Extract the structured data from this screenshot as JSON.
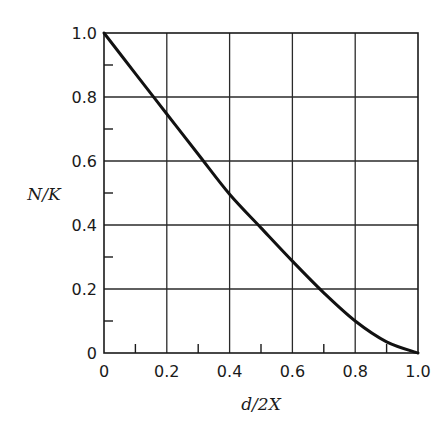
{
  "chart_data": {
    "type": "line",
    "title": "",
    "xlabel": "d/2X",
    "ylabel": "N/K",
    "xlim": [
      0,
      1.0
    ],
    "ylim": [
      0,
      1.0
    ],
    "grid": true,
    "legend": null,
    "x_ticks_major": [
      "0",
      "0.2",
      "0.4",
      "0.6",
      "0.8",
      "1.0"
    ],
    "y_ticks_major": [
      "0",
      "0.2",
      "0.4",
      "0.6",
      "0.8",
      "1.0"
    ],
    "minor_ticks": [
      0.1,
      0.3,
      0.5,
      0.7,
      0.9
    ],
    "series": [
      {
        "name": "N/K",
        "x": [
          0,
          0.1,
          0.2,
          0.3,
          0.4,
          0.5,
          0.6,
          0.7,
          0.8,
          0.9,
          1.0
        ],
        "values": [
          1.0,
          0.873,
          0.747,
          0.621,
          0.496,
          0.391,
          0.287,
          0.188,
          0.1,
          0.035,
          0.0
        ]
      }
    ]
  },
  "axes": {
    "x_label": "d/2X",
    "y_label": "N/K"
  }
}
